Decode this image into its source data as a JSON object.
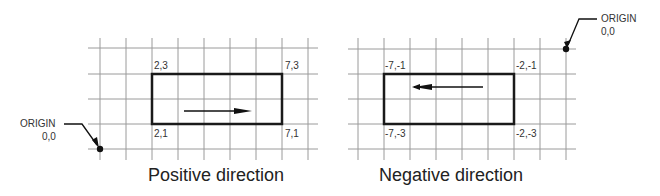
{
  "diagrams": [
    {
      "name": "positive",
      "caption": "Positive direction",
      "corners": {
        "top_left": "2,3",
        "top_right": "7,3",
        "bottom_left": "2,1",
        "bottom_right": "7,1"
      },
      "origin": {
        "label": "ORIGIN",
        "coords": "0,0"
      },
      "arrow_direction": "right"
    },
    {
      "name": "negative",
      "caption": "Negative direction",
      "corners": {
        "top_left": "-7,-1",
        "top_right": "-2,-1",
        "bottom_left": "-7,-3",
        "bottom_right": "-2,-3"
      },
      "origin": {
        "label": "ORIGIN",
        "coords": "0,0"
      },
      "arrow_direction": "left"
    }
  ],
  "colors": {
    "grid": "#9a9a9a",
    "rect": "#1a1a1a",
    "text": "#333333"
  }
}
